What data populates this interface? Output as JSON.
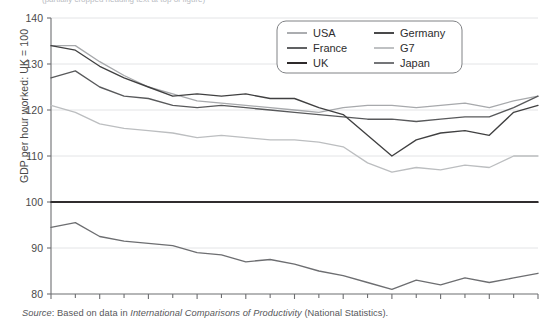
{
  "figure": {
    "cropped_title_fragment": "(partially cropped heading text at top of figure)",
    "source_note": {
      "label": "Source",
      "separator": ": Based on data in ",
      "work_title": "International Comparisons of Productivity",
      "suffix": " (National Statistics)."
    }
  },
  "chart_data": {
    "type": "line",
    "title": "",
    "xlabel": "",
    "ylabel": "GDP per hour worked: UK = 100",
    "xlim": [
      1990,
      2010
    ],
    "ylim": [
      80,
      140
    ],
    "yticks": [
      80,
      90,
      100,
      110,
      120,
      130,
      140
    ],
    "xticks": [
      1990,
      1992,
      1994,
      1996,
      1998,
      2000,
      2002,
      2004,
      2006,
      2008,
      2010
    ],
    "x_minor_ticks": [
      1991,
      1993,
      1995,
      1997,
      1999,
      2001,
      2003,
      2005,
      2007,
      2009
    ],
    "grid": "horizontal",
    "legend_position": "top-right",
    "x": [
      1990,
      1991,
      1992,
      1993,
      1994,
      1995,
      1996,
      1997,
      1998,
      1999,
      2000,
      2001,
      2002,
      2003,
      2004,
      2005,
      2006,
      2007,
      2008,
      2009,
      2010
    ],
    "series": [
      {
        "name": "USA",
        "color": "#a7a9ac",
        "values": [
          134.0,
          134.0,
          130.5,
          127.5,
          125.0,
          123.5,
          122.0,
          121.5,
          121.0,
          120.5,
          120.0,
          119.5,
          120.5,
          121.0,
          121.0,
          120.5,
          121.0,
          121.5,
          120.5,
          122.0,
          123.0
        ]
      },
      {
        "name": "France",
        "color": "#58595b",
        "values": [
          127.0,
          128.5,
          125.0,
          123.0,
          122.5,
          121.0,
          120.5,
          121.0,
          120.5,
          120.0,
          119.5,
          119.0,
          118.5,
          118.0,
          118.0,
          117.5,
          118.0,
          118.5,
          118.5,
          120.5,
          123.0
        ]
      },
      {
        "name": "UK",
        "color": "#231f20",
        "values": [
          100,
          100,
          100,
          100,
          100,
          100,
          100,
          100,
          100,
          100,
          100,
          100,
          100,
          100,
          100,
          100,
          100,
          100,
          100,
          100,
          100
        ]
      },
      {
        "name": "Germany",
        "color": "#404041",
        "values": [
          134.0,
          133.0,
          129.5,
          127.0,
          125.0,
          123.0,
          123.5,
          123.0,
          123.5,
          122.5,
          122.5,
          120.5,
          119.0,
          114.5,
          110.0,
          113.5,
          115.0,
          115.5,
          114.5,
          119.5,
          121.0
        ]
      },
      {
        "name": "G7",
        "color": "#bcbec0",
        "values": [
          121.0,
          119.5,
          117.0,
          116.0,
          115.5,
          115.0,
          114.0,
          114.5,
          114.0,
          113.5,
          113.5,
          113.0,
          112.0,
          108.5,
          106.5,
          107.5,
          107.0,
          108.0,
          107.5,
          110.0,
          110.0
        ]
      },
      {
        "name": "Japan",
        "color": "#6d6e71",
        "values": [
          94.5,
          95.5,
          92.5,
          91.5,
          91.0,
          90.5,
          89.0,
          88.5,
          87.0,
          87.5,
          86.5,
          85.0,
          84.0,
          82.5,
          81.0,
          83.0,
          82.0,
          83.5,
          82.5,
          83.5,
          84.5
        ]
      }
    ]
  },
  "legend": {
    "items": [
      {
        "label": "USA",
        "color": "#a7a9ac"
      },
      {
        "label": "Germany",
        "color": "#404041"
      },
      {
        "label": "France",
        "color": "#58595b"
      },
      {
        "label": "G7",
        "color": "#bcbec0"
      },
      {
        "label": "UK",
        "color": "#231f20"
      },
      {
        "label": "Japan",
        "color": "#6d6e71"
      }
    ]
  },
  "axes": {
    "y_tick_labels": [
      "140",
      "130",
      "120",
      "110",
      "100",
      "90",
      "80"
    ],
    "x_tick_labels": [
      "1990",
      "1992",
      "1994",
      "1996",
      "1998",
      "2000",
      "2002",
      "2004",
      "2006",
      "2008",
      "2010"
    ]
  }
}
